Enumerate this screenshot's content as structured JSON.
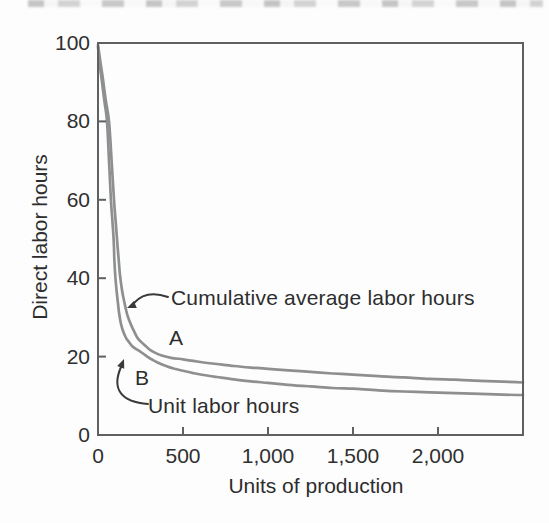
{
  "figure": {
    "background": "#fdfdfd",
    "ink_color": "#2d2d2d",
    "axis_color": "#5e6062",
    "curve_color": "#8e8f90"
  },
  "chart_data": {
    "type": "line",
    "title": "",
    "xlabel": "Units of production",
    "ylabel": "Direct labor hours",
    "xlim": [
      0,
      2500
    ],
    "ylim": [
      0,
      100
    ],
    "x_ticks": [
      0,
      500,
      1000,
      1500,
      2000
    ],
    "x_tick_labels": [
      "0",
      "500",
      "1,000",
      "1,500",
      "2,000"
    ],
    "y_ticks": [
      0,
      20,
      40,
      60,
      80,
      100
    ],
    "y_tick_labels": [
      "0",
      "20",
      "40",
      "60",
      "80",
      "100"
    ],
    "grid": false,
    "legend_position": "inline-annotations-with-arrows",
    "frame": "full-box",
    "series": [
      {
        "name": "Cumulative average labor hours",
        "point_label": "A",
        "points": [
          [
            0,
            99.5
          ],
          [
            15,
            95
          ],
          [
            30,
            90.5
          ],
          [
            45,
            85.5
          ],
          [
            65,
            80
          ],
          [
            80,
            70
          ],
          [
            94,
            60
          ],
          [
            103,
            55
          ],
          [
            112,
            50
          ],
          [
            121,
            45
          ],
          [
            129,
            41
          ],
          [
            141,
            37
          ],
          [
            153,
            34.3
          ],
          [
            170,
            31
          ],
          [
            186,
            29
          ],
          [
            202,
            27.4
          ],
          [
            229,
            25
          ],
          [
            252,
            23.8
          ],
          [
            275,
            22.9
          ],
          [
            306,
            21.7
          ],
          [
            340,
            20.9
          ],
          [
            380,
            20.2
          ],
          [
            430,
            19.7
          ],
          [
            500,
            19.3
          ],
          [
            560,
            18.9
          ],
          [
            620,
            18.5
          ],
          [
            700,
            18.1
          ],
          [
            800,
            17.6
          ],
          [
            900,
            17.2
          ],
          [
            1000,
            16.9
          ],
          [
            1120,
            16.5
          ],
          [
            1250,
            16.1
          ],
          [
            1380,
            15.7
          ],
          [
            1500,
            15.4
          ],
          [
            1650,
            15.0
          ],
          [
            1800,
            14.7
          ],
          [
            1950,
            14.3
          ],
          [
            2100,
            14.1
          ],
          [
            2250,
            13.8
          ],
          [
            2380,
            13.6
          ],
          [
            2500,
            13.4
          ]
        ]
      },
      {
        "name": "Unit labor hours",
        "point_label": "B",
        "points": [
          [
            0,
            99
          ],
          [
            12,
            94
          ],
          [
            25,
            89.5
          ],
          [
            40,
            84.5
          ],
          [
            53,
            80
          ],
          [
            65,
            70
          ],
          [
            76,
            60
          ],
          [
            84,
            55
          ],
          [
            92,
            50
          ],
          [
            96,
            45
          ],
          [
            101,
            41
          ],
          [
            109,
            37
          ],
          [
            117,
            33.8
          ],
          [
            125,
            30.8
          ],
          [
            136,
            28.2
          ],
          [
            150,
            26.2
          ],
          [
            165,
            24.8
          ],
          [
            177,
            24
          ],
          [
            200,
            22.7
          ],
          [
            225,
            21.9
          ],
          [
            248,
            21.3
          ],
          [
            280,
            20.3
          ],
          [
            312,
            19.4
          ],
          [
            350,
            18.5
          ],
          [
            400,
            17.6
          ],
          [
            450,
            16.9
          ],
          [
            500,
            16.4
          ],
          [
            560,
            15.8
          ],
          [
            620,
            15.3
          ],
          [
            700,
            14.8
          ],
          [
            800,
            14.2
          ],
          [
            900,
            13.7
          ],
          [
            1000,
            13.3
          ],
          [
            1120,
            12.8
          ],
          [
            1250,
            12.4
          ],
          [
            1380,
            12.0
          ],
          [
            1500,
            11.8
          ],
          [
            1650,
            11.4
          ],
          [
            1800,
            11.1
          ],
          [
            1950,
            10.9
          ],
          [
            2100,
            10.7
          ],
          [
            2250,
            10.5
          ],
          [
            2380,
            10.3
          ],
          [
            2500,
            10.2
          ]
        ]
      }
    ]
  }
}
